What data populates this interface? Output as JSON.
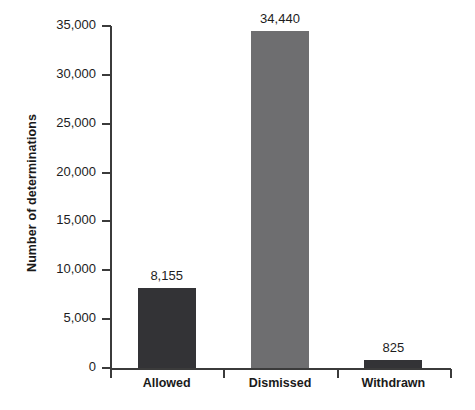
{
  "chart_data": {
    "type": "bar",
    "title": "",
    "subtitle": "",
    "xlabel": "",
    "ylabel": "Number of determinations",
    "categories": [
      "Allowed",
      "Dismissed",
      "Withdrawn"
    ],
    "values": [
      8155,
      34440,
      825
    ],
    "value_labels": [
      "8,155",
      "34,440",
      "825"
    ],
    "bar_colors": [
      "#333336",
      "#6e6e70",
      "#333336"
    ],
    "ylim": [
      0,
      35000
    ],
    "ytick_values": [
      0,
      5000,
      10000,
      15000,
      20000,
      25000,
      30000,
      35000
    ],
    "ytick_labels": [
      "0",
      "5,000",
      "10,000",
      "15,000",
      "20,000",
      "25,000",
      "30,000",
      "35,000"
    ],
    "grid": false,
    "legend": null,
    "axis_color": "#3b3b3b",
    "background": "#ffffff"
  }
}
